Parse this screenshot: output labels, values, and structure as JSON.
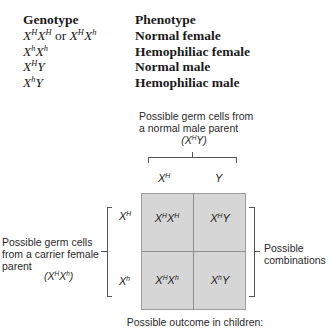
{
  "table": {
    "headers": {
      "genotype": "Genotype",
      "phenotype": "Phenotype"
    },
    "rows": [
      {
        "genotype_html": "X<sup>H</sup>X<sup>H</sup> <span style=\"font-style:normal\">or</span> X<sup>H</sup>X<sup>h</sup>",
        "genotype": "XHXH or XHXh",
        "phenotype": "Normal female"
      },
      {
        "genotype_html": "X<sup>h</sup>X<sup>h</sup>",
        "genotype": "XhXh",
        "phenotype": "Hemophiliac female"
      },
      {
        "genotype_html": "X<sup>H</sup>Y",
        "genotype": "XHY",
        "phenotype": "Normal male"
      },
      {
        "genotype_html": "X<sup>h</sup>Y",
        "genotype": "XhY",
        "phenotype": "Hemophiliac male"
      }
    ]
  },
  "punnett": {
    "male_parent_label_line1": "Possible germ cells from",
    "male_parent_label_line2": "a normal male parent",
    "male_parent_genotype_html": "(X<sup>H</sup>Y)",
    "female_parent_label_line1": "Possible germ cells",
    "female_parent_label_line2": "from a carrier female",
    "female_parent_label_line3": "parent",
    "female_parent_genotype_html": "(X<sup>H</sup>X<sup>h</sup>)",
    "male_alleles_html": [
      "X<sup>H</sup>",
      "Y"
    ],
    "female_alleles_html": [
      "X<sup>H</sup>",
      "X<sup>h</sup>"
    ],
    "cells_html": [
      [
        "X<sup>H</sup>X<sup>H</sup>",
        "X<sup>H</sup>Y"
      ],
      [
        "X<sup>H</sup>X<sup>h</sup>",
        "X<sup>h</sup>Y"
      ]
    ],
    "combinations_label_line1": "Possible",
    "combinations_label_line2": "combinations",
    "outcome_label": "Possible outcome in children:"
  },
  "colors": {
    "grid_fill": "#d6d6d6",
    "grid_border": "#9d9d9d",
    "line": "#555555"
  }
}
